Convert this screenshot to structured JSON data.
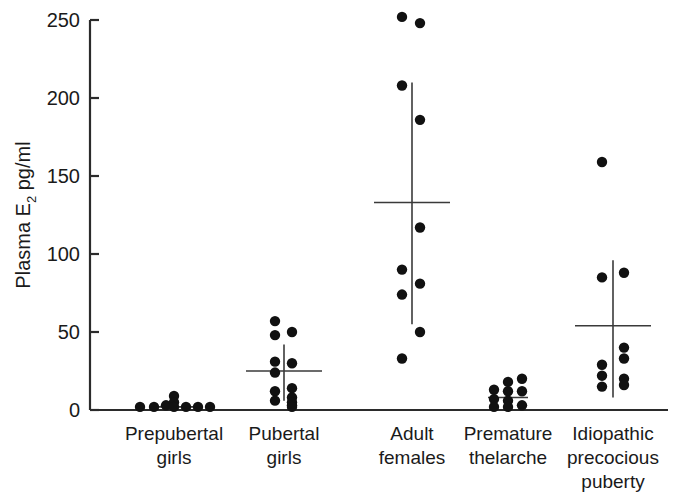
{
  "chart_data": {
    "type": "scatter",
    "title": "",
    "xlabel": "",
    "ylabel": "Plasma E2 pg/ml",
    "ylabel_main": "Plasma E",
    "ylabel_sub": "2",
    "ylabel_tail": " pg/ml",
    "ylim": [
      0,
      250
    ],
    "yticks": [
      0,
      50,
      100,
      150,
      200,
      250
    ],
    "ytick_labels": [
      "0",
      "50",
      "100",
      "150",
      "200",
      "250"
    ],
    "grid": false,
    "legend": "none",
    "marker": "filled-circle",
    "marker_color": "#111111",
    "axis_color": "#2b2b2b",
    "background": "#ffffff",
    "categories": [
      "Prepubertal girls",
      "Pubertal girls",
      "Adult females",
      "Premature thelarche",
      "Idiopathic precocious puberty"
    ],
    "category_label_lines": [
      [
        "Prepubertal",
        "girls"
      ],
      [
        "Pubertal",
        "girls"
      ],
      [
        "Adult",
        "females"
      ],
      [
        "Premature",
        "thelarche"
      ],
      [
        "Idiopathic",
        "precocious",
        "puberty"
      ]
    ],
    "groups": [
      {
        "name": "Prepubertal girls",
        "mean": 2,
        "sd_upper": 5,
        "sd_lower": 0,
        "n": 9,
        "points": [
          {
            "value": 2,
            "offset": -34
          },
          {
            "value": 2,
            "offset": -20
          },
          {
            "value": 3,
            "offset": -8
          },
          {
            "value": 9,
            "offset": 0
          },
          {
            "value": 5,
            "offset": 0
          },
          {
            "value": 2,
            "offset": 0
          },
          {
            "value": 2,
            "offset": 12
          },
          {
            "value": 2,
            "offset": 24
          },
          {
            "value": 2,
            "offset": 36
          }
        ]
      },
      {
        "name": "Pubertal girls",
        "mean": 25,
        "sd_upper": 42,
        "sd_lower": 6,
        "n": 13,
        "points": [
          {
            "value": 57,
            "offset": -9
          },
          {
            "value": 48,
            "offset": -9
          },
          {
            "value": 50,
            "offset": 8
          },
          {
            "value": 31,
            "offset": -9
          },
          {
            "value": 30,
            "offset": 8
          },
          {
            "value": 24,
            "offset": -9
          },
          {
            "value": 14,
            "offset": 8
          },
          {
            "value": 12,
            "offset": -9
          },
          {
            "value": 8,
            "offset": 8
          },
          {
            "value": 6,
            "offset": -9
          },
          {
            "value": 5,
            "offset": 8
          },
          {
            "value": 3,
            "offset": 8
          },
          {
            "value": 2,
            "offset": 8
          }
        ]
      },
      {
        "name": "Adult females",
        "mean": 133,
        "sd_upper": 210,
        "sd_lower": 55,
        "n": 11,
        "points": [
          {
            "value": 252,
            "offset": -10
          },
          {
            "value": 248,
            "offset": 8
          },
          {
            "value": 208,
            "offset": -10
          },
          {
            "value": 186,
            "offset": 8
          },
          {
            "value": 117,
            "offset": 8
          },
          {
            "value": 90,
            "offset": -10
          },
          {
            "value": 81,
            "offset": 8
          },
          {
            "value": 74,
            "offset": -10
          },
          {
            "value": 50,
            "offset": 8
          },
          {
            "value": 33,
            "offset": -10
          }
        ]
      },
      {
        "name": "Premature thelarche",
        "mean": 8,
        "sd_upper": 16,
        "sd_lower": 1,
        "n": 11,
        "points": [
          {
            "value": 13,
            "offset": -14
          },
          {
            "value": 7,
            "offset": -14
          },
          {
            "value": 2,
            "offset": -14
          },
          {
            "value": 18,
            "offset": 0
          },
          {
            "value": 12,
            "offset": 0
          },
          {
            "value": 6,
            "offset": 0
          },
          {
            "value": 2,
            "offset": 0
          },
          {
            "value": 20,
            "offset": 14
          },
          {
            "value": 12,
            "offset": 14
          },
          {
            "value": 3,
            "offset": 14
          }
        ]
      },
      {
        "name": "Idiopathic precocious puberty",
        "mean": 54,
        "sd_upper": 96,
        "sd_lower": 8,
        "n": 10,
        "points": [
          {
            "value": 159,
            "offset": -11
          },
          {
            "value": 85,
            "offset": -11
          },
          {
            "value": 88,
            "offset": 11
          },
          {
            "value": 40,
            "offset": 11
          },
          {
            "value": 33,
            "offset": 11
          },
          {
            "value": 29,
            "offset": -11
          },
          {
            "value": 22,
            "offset": -11
          },
          {
            "value": 20,
            "offset": 11
          },
          {
            "value": 16,
            "offset": 11
          },
          {
            "value": 15,
            "offset": -11
          }
        ]
      }
    ]
  },
  "figure": {
    "caption": ""
  }
}
